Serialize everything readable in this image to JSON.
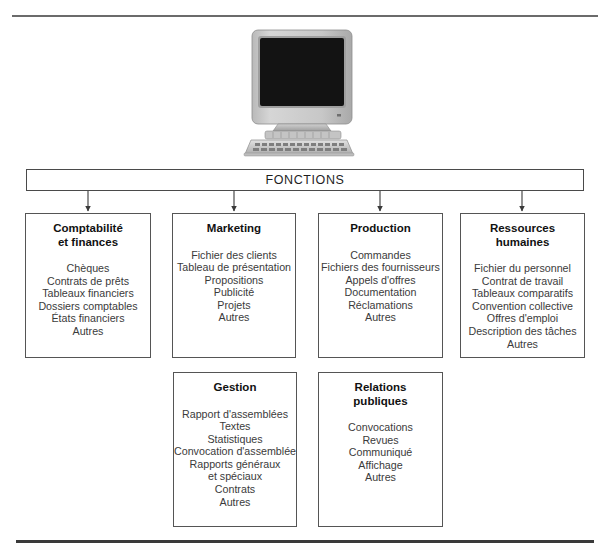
{
  "diagram": {
    "root": {
      "label": "FONCTIONS"
    },
    "illustration": {
      "name": "desktop-computer-illustration"
    },
    "boxes": [
      {
        "id": "comptabilite-et-finances",
        "title": "Comptabilité\net finances",
        "items": [
          "Chèques",
          "Contrats de prêts",
          "Tableaux financiers",
          "Dossiers comptables",
          "États financiers",
          "Autres"
        ]
      },
      {
        "id": "marketing",
        "title": "Marketing",
        "items": [
          "Fichier des clients",
          "Tableau de présentation",
          "Propositions",
          "Publicité",
          "Projets",
          "Autres"
        ]
      },
      {
        "id": "production",
        "title": "Production",
        "items": [
          "Commandes",
          "Fichiers des fournisseurs",
          "Appels d'offres",
          "Documentation",
          "Réclamations",
          "Autres"
        ]
      },
      {
        "id": "ressources-humaines",
        "title": "Ressources\nhumaines",
        "items": [
          "Fichier du personnel",
          "Contrat de travail",
          "Tableaux comparatifs",
          "Convention collective",
          "Offres d'emploi",
          "Description des tâches",
          "Autres"
        ]
      },
      {
        "id": "gestion",
        "title": "Gestion",
        "items": [
          "Rapport d'assemblées",
          "Textes",
          "Statistiques",
          "Convocation d'assemblée",
          "Rapports généraux",
          "et spéciaux",
          "Contrats",
          "Autres"
        ]
      },
      {
        "id": "relations-publiques",
        "title": "Relations\npubliques",
        "items": [
          "Convocations",
          "Revues",
          "Communiqué",
          "Affichage",
          "Autres"
        ]
      }
    ],
    "colors": {
      "border": "#555555",
      "text": "#3b3b3b",
      "title": "#111111",
      "rule": "#6b6b6b",
      "rule_bottom": "#3a3a3a",
      "screen": "#111111",
      "case": "#c9c9c9"
    }
  }
}
